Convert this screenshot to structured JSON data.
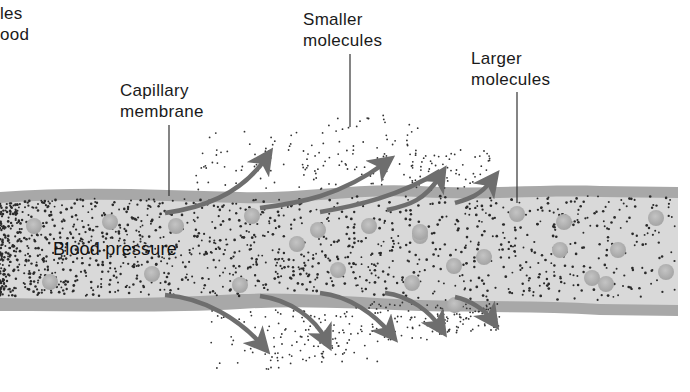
{
  "figure": {
    "colors": {
      "membrane": "#a8a8a8",
      "vessel_fill": "#d9d9d9",
      "large_molecule": "#b0b0b0",
      "small_molecule": "#2a2a2a",
      "arrow": "#6e6e6e",
      "text": "#1a1a1a"
    },
    "labels": {
      "cutoff_left": {
        "line1": "les",
        "line2": "ood"
      },
      "capillary_membrane": {
        "line1": "Capillary",
        "line2": "membrane"
      },
      "smaller_molecules": {
        "line1": "Smaller",
        "line2": "molecules"
      },
      "larger_molecules": {
        "line1": "Larger",
        "line2": "molecules"
      },
      "blood_pressure": "Blood pressure"
    },
    "arrows_up_count": 5,
    "arrows_down_count": 5
  }
}
